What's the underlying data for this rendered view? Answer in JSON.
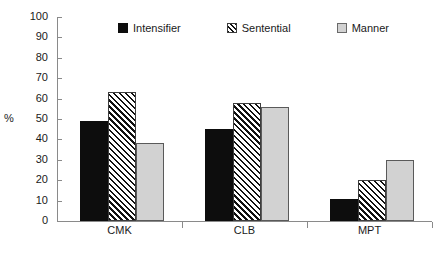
{
  "chart_data": {
    "type": "bar",
    "title": "",
    "subtitle": "",
    "xlabel": "",
    "ylabel": "%",
    "ylim": [
      0,
      100
    ],
    "ytick_step": 10,
    "yticks": [
      100,
      90,
      80,
      70,
      60,
      50,
      40,
      30,
      20,
      10,
      0
    ],
    "categories": [
      "CMK",
      "CLB",
      "MPT"
    ],
    "grid": false,
    "legend_position": "top-center",
    "series": [
      {
        "name": "Intensifier",
        "values": [
          49,
          45,
          11
        ],
        "fill": "solid-black",
        "color": "#0d0d0d"
      },
      {
        "name": "Sentential",
        "values": [
          63,
          58,
          20
        ],
        "fill": "diagonal-hatch",
        "color": "#111111"
      },
      {
        "name": "Manner",
        "values": [
          38,
          56,
          30
        ],
        "fill": "solid-gray",
        "color": "#d2d2d2"
      }
    ]
  },
  "legend": {
    "items": [
      {
        "label": "Intensifier"
      },
      {
        "label": "Sentential"
      },
      {
        "label": "Manner"
      }
    ]
  },
  "axes": {
    "y_title": "%",
    "y_labels": [
      "100",
      "90",
      "80",
      "70",
      "60",
      "50",
      "40",
      "30",
      "20",
      "10",
      "0"
    ],
    "x_labels": [
      "CMK",
      "CLB",
      "MPT"
    ]
  }
}
